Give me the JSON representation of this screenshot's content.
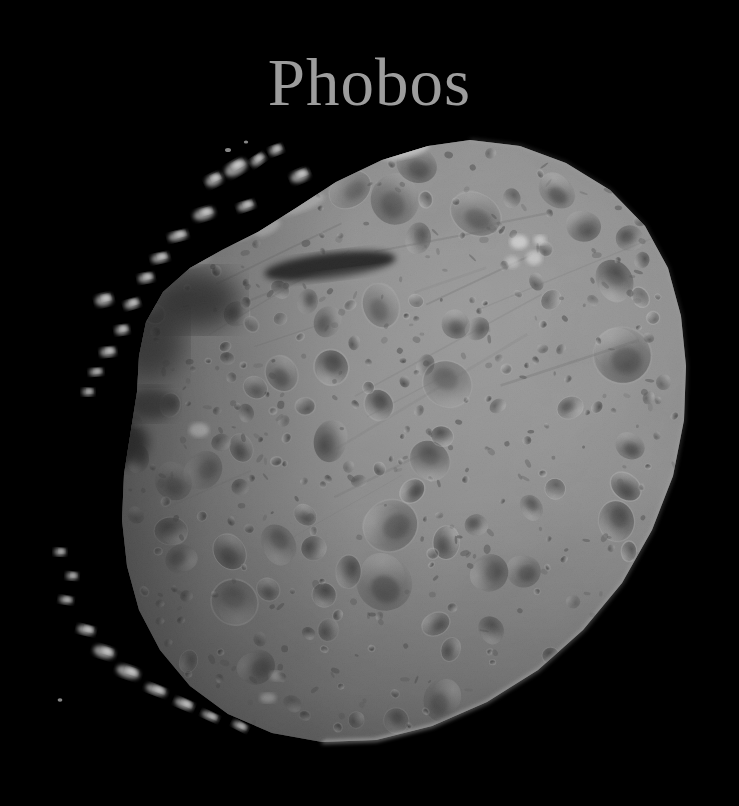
{
  "image": {
    "subject": "Phobos",
    "kind": "spacecraft-photograph",
    "background_color": "#000000",
    "width": 739,
    "height": 806
  },
  "title": {
    "text": "Phobos",
    "color": "#9d9d9d",
    "font_style": "serif",
    "font_size_px": 67,
    "center_x": 356,
    "top_y": 49
  },
  "body": {
    "name": "Phobos",
    "description": "Heavily cratered irregular moon lit from the right, black space background",
    "surface_color_mid": "#8d8d8d",
    "surface_color_light": "#bdbdbd",
    "surface_color_dark": "#3a3a3a",
    "shadow_color": "#000000",
    "limb_highlight_color": "#d8d8d8",
    "bounds": {
      "left": 42,
      "top": 138,
      "right": 688,
      "bottom": 775
    },
    "outline": "M 470 140 L 520 146 L 566 163 L 610 190 L 645 226 L 668 268 L 681 316 L 686 366 L 684 420 L 673 476 L 652 530 L 622 583 L 583 630 L 538 670 L 487 702 L 432 726 L 376 740 L 322 742 L 272 733 L 228 714 L 190 686 L 160 650 L 139 610 L 127 566 L 122 520 L 124 474 L 131 430 L 137 392 L 139 356 L 146 322 L 163 292 L 190 268 L 222 250 L 258 232 L 296 208 L 336 182 L 382 160 L 428 146 Z",
    "terminator_side": "left",
    "illumination_from": "upper-right"
  },
  "features": {
    "elongated_shadow_crater": {
      "cx": 330,
      "cy": 266,
      "rx": 66,
      "ry": 13,
      "rotation": -7
    },
    "bright_ridges_top_left": true,
    "dark_pocket_left": {
      "cx": 106,
      "cy": 442,
      "rx": 40,
      "ry": 26
    },
    "crater_cluster_bottom": {
      "cx": 278,
      "cy": 672
    }
  }
}
